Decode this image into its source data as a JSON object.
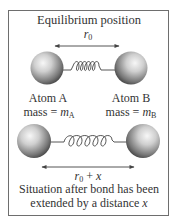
{
  "diagram": {
    "title": "Equilibrium position",
    "top": {
      "distance_label": {
        "var": "r",
        "sub": "0"
      },
      "atom_a": {
        "name": "Atom A",
        "mass_prefix": "mass = ",
        "mass_var": "m",
        "mass_sub": "A"
      },
      "atom_b": {
        "name": "Atom B",
        "mass_prefix": "mass = ",
        "mass_var": "m",
        "mass_sub": "B"
      }
    },
    "bottom": {
      "distance_label": {
        "var": "r",
        "sub": "0",
        "plus": " + ",
        "ext": "x"
      },
      "caption_line1": "Situation after bond has been",
      "caption_line2_prefix": "extended by a distance ",
      "caption_line2_var": "x"
    },
    "colors": {
      "frame": "#6e6e6e",
      "atom_light": "#f4f4f4",
      "atom_dark": "#3a3a3a",
      "spring": "#444444",
      "text": "#333333"
    }
  }
}
